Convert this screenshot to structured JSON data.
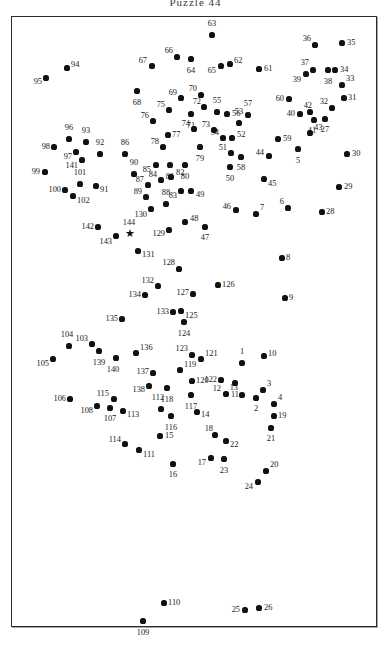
{
  "title": "Puzzle 44",
  "frame": {
    "x": 11,
    "y": 16,
    "width": 366,
    "height": 611,
    "border_color": "#2b2b2b"
  },
  "puzzle": {
    "type": "connect-the-dots",
    "dot_color": "#111111",
    "label_color": "#1a1a1a",
    "start_marker": "★",
    "start_marker_label": "144",
    "total_points": 144
  },
  "chart_data": {
    "type": "scatter",
    "title": "Puzzle 44",
    "xlabel": "",
    "ylabel": "",
    "xlim": [
      0,
      391
    ],
    "ylim": [
      647,
      0
    ],
    "grid": false,
    "legend": "none",
    "points": [
      {
        "n": "1",
        "x": 241,
        "y": 362,
        "lx": 241,
        "ly": 355,
        "pos": "t"
      },
      {
        "n": "2",
        "x": 255,
        "y": 397,
        "lx": 255,
        "ly": 404,
        "pos": "b"
      },
      {
        "n": "3",
        "x": 262,
        "y": 389,
        "lx": 266,
        "ly": 383,
        "pos": "r"
      },
      {
        "n": "4",
        "x": 273,
        "y": 403,
        "lx": 277,
        "ly": 397,
        "pos": "r"
      },
      {
        "n": "5",
        "x": 297,
        "y": 148,
        "lx": 297,
        "ly": 156,
        "pos": "b"
      },
      {
        "n": "6",
        "x": 287,
        "y": 207,
        "lx": 283,
        "ly": 201,
        "pos": "l"
      },
      {
        "n": "7",
        "x": 255,
        "y": 213,
        "lx": 259,
        "ly": 207,
        "pos": "r"
      },
      {
        "n": "8",
        "x": 281,
        "y": 257,
        "lx": 285,
        "ly": 257,
        "pos": "r"
      },
      {
        "n": "9",
        "x": 284,
        "y": 297,
        "lx": 288,
        "ly": 297,
        "pos": "r"
      },
      {
        "n": "10",
        "x": 263,
        "y": 355,
        "lx": 267,
        "ly": 353,
        "pos": "r"
      },
      {
        "n": "11",
        "x": 234,
        "y": 382,
        "lx": 234,
        "ly": 390,
        "pos": "b"
      },
      {
        "n": "12",
        "x": 225,
        "y": 393,
        "lx": 220,
        "ly": 388,
        "pos": "l"
      },
      {
        "n": "13",
        "x": 241,
        "y": 394,
        "lx": 237,
        "ly": 387,
        "pos": "l"
      },
      {
        "n": "14",
        "x": 196,
        "y": 411,
        "lx": 200,
        "ly": 414,
        "pos": "r"
      },
      {
        "n": "15",
        "x": 159,
        "y": 435,
        "lx": 164,
        "ly": 435,
        "pos": "r"
      },
      {
        "n": "16",
        "x": 172,
        "y": 463,
        "lx": 172,
        "ly": 470,
        "pos": "b"
      },
      {
        "n": "17",
        "x": 210,
        "y": 457,
        "lx": 205,
        "ly": 462,
        "pos": "l"
      },
      {
        "n": "18",
        "x": 214,
        "y": 434,
        "lx": 212,
        "ly": 428,
        "pos": "l"
      },
      {
        "n": "19",
        "x": 273,
        "y": 415,
        "lx": 277,
        "ly": 415,
        "pos": "r"
      },
      {
        "n": "20",
        "x": 265,
        "y": 470,
        "lx": 269,
        "ly": 464,
        "pos": "r"
      },
      {
        "n": "21",
        "x": 270,
        "y": 427,
        "lx": 270,
        "ly": 434,
        "pos": "b"
      },
      {
        "n": "22",
        "x": 225,
        "y": 440,
        "lx": 229,
        "ly": 444,
        "pos": "r"
      },
      {
        "n": "23",
        "x": 223,
        "y": 458,
        "lx": 223,
        "ly": 466,
        "pos": "b"
      },
      {
        "n": "24",
        "x": 257,
        "y": 481,
        "lx": 252,
        "ly": 486,
        "pos": "l"
      },
      {
        "n": "25",
        "x": 244,
        "y": 609,
        "lx": 239,
        "ly": 609,
        "pos": "l"
      },
      {
        "n": "26",
        "x": 258,
        "y": 607,
        "lx": 263,
        "ly": 607,
        "pos": "r"
      },
      {
        "n": "27",
        "x": 324,
        "y": 118,
        "lx": 324,
        "ly": 125,
        "pos": "b"
      },
      {
        "n": "28",
        "x": 321,
        "y": 211,
        "lx": 325,
        "ly": 211,
        "pos": "r"
      },
      {
        "n": "29",
        "x": 338,
        "y": 186,
        "lx": 343,
        "ly": 186,
        "pos": "r"
      },
      {
        "n": "30",
        "x": 346,
        "y": 153,
        "lx": 351,
        "ly": 153,
        "pos": "r"
      },
      {
        "n": "31",
        "x": 343,
        "y": 97,
        "lx": 347,
        "ly": 97,
        "pos": "r"
      },
      {
        "n": "32",
        "x": 331,
        "y": 107,
        "lx": 327,
        "ly": 101,
        "pos": "l"
      },
      {
        "n": "33",
        "x": 341,
        "y": 84,
        "lx": 345,
        "ly": 78,
        "pos": "r"
      },
      {
        "n": "34",
        "x": 334,
        "y": 69,
        "lx": 339,
        "ly": 69,
        "pos": "r"
      },
      {
        "n": "35",
        "x": 341,
        "y": 42,
        "lx": 346,
        "ly": 42,
        "pos": "r"
      },
      {
        "n": "36",
        "x": 314,
        "y": 44,
        "lx": 310,
        "ly": 38,
        "pos": "l"
      },
      {
        "n": "37",
        "x": 312,
        "y": 69,
        "lx": 308,
        "ly": 62,
        "pos": "l"
      },
      {
        "n": "38",
        "x": 327,
        "y": 69,
        "lx": 327,
        "ly": 77,
        "pos": "b"
      },
      {
        "n": "39",
        "x": 305,
        "y": 73,
        "lx": 300,
        "ly": 79,
        "pos": "l"
      },
      {
        "n": "40",
        "x": 299,
        "y": 113,
        "lx": 294,
        "ly": 113,
        "pos": "l"
      },
      {
        "n": "41",
        "x": 313,
        "y": 119,
        "lx": 311,
        "ly": 126,
        "pos": "b"
      },
      {
        "n": "42",
        "x": 309,
        "y": 111,
        "lx": 311,
        "ly": 105,
        "pos": "l"
      },
      {
        "n": "43",
        "x": 309,
        "y": 132,
        "lx": 313,
        "ly": 127,
        "pos": "r"
      },
      {
        "n": "44",
        "x": 268,
        "y": 155,
        "lx": 263,
        "ly": 152,
        "pos": "l"
      },
      {
        "n": "45",
        "x": 263,
        "y": 178,
        "lx": 267,
        "ly": 183,
        "pos": "r"
      },
      {
        "n": "46",
        "x": 235,
        "y": 209,
        "lx": 230,
        "ly": 206,
        "pos": "l"
      },
      {
        "n": "47",
        "x": 204,
        "y": 226,
        "lx": 204,
        "ly": 233,
        "pos": "b"
      },
      {
        "n": "48",
        "x": 184,
        "y": 221,
        "lx": 189,
        "ly": 218,
        "pos": "r"
      },
      {
        "n": "49",
        "x": 190,
        "y": 190,
        "lx": 195,
        "ly": 194,
        "pos": "r"
      },
      {
        "n": "50",
        "x": 229,
        "y": 166,
        "lx": 229,
        "ly": 174,
        "pos": "b"
      },
      {
        "n": "51",
        "x": 230,
        "y": 152,
        "lx": 226,
        "ly": 147,
        "pos": "l"
      },
      {
        "n": "52",
        "x": 231,
        "y": 137,
        "lx": 236,
        "ly": 134,
        "pos": "r"
      },
      {
        "n": "53",
        "x": 238,
        "y": 122,
        "lx": 238,
        "ly": 115,
        "pos": "t"
      },
      {
        "n": "54",
        "x": 222,
        "y": 137,
        "lx": 218,
        "ly": 132,
        "pos": "l"
      },
      {
        "n": "55",
        "x": 216,
        "y": 111,
        "lx": 216,
        "ly": 104,
        "pos": "t"
      },
      {
        "n": "56",
        "x": 226,
        "y": 113,
        "lx": 231,
        "ly": 113,
        "pos": "r"
      },
      {
        "n": "57",
        "x": 247,
        "y": 114,
        "lx": 247,
        "ly": 107,
        "pos": "t"
      },
      {
        "n": "58",
        "x": 240,
        "y": 156,
        "lx": 240,
        "ly": 163,
        "pos": "b"
      },
      {
        "n": "59",
        "x": 277,
        "y": 138,
        "lx": 282,
        "ly": 138,
        "pos": "r"
      },
      {
        "n": "60",
        "x": 288,
        "y": 98,
        "lx": 283,
        "ly": 98,
        "pos": "l"
      },
      {
        "n": "61",
        "x": 258,
        "y": 68,
        "lx": 263,
        "ly": 68,
        "pos": "r"
      },
      {
        "n": "62",
        "x": 229,
        "y": 63,
        "lx": 233,
        "ly": 60,
        "pos": "r"
      },
      {
        "n": "63",
        "x": 211,
        "y": 34,
        "lx": 211,
        "ly": 27,
        "pos": "t"
      },
      {
        "n": "64",
        "x": 190,
        "y": 58,
        "lx": 190,
        "ly": 66,
        "pos": "b"
      },
      {
        "n": "65",
        "x": 220,
        "y": 65,
        "lx": 215,
        "ly": 70,
        "pos": "l"
      },
      {
        "n": "66",
        "x": 176,
        "y": 56,
        "lx": 172,
        "ly": 50,
        "pos": "l"
      },
      {
        "n": "67",
        "x": 151,
        "y": 65,
        "lx": 146,
        "ly": 60,
        "pos": "l"
      },
      {
        "n": "68",
        "x": 136,
        "y": 90,
        "lx": 136,
        "ly": 98,
        "pos": "b"
      },
      {
        "n": "69",
        "x": 180,
        "y": 97,
        "lx": 176,
        "ly": 92,
        "pos": "l"
      },
      {
        "n": "70",
        "x": 200,
        "y": 94,
        "lx": 196,
        "ly": 88,
        "pos": "l"
      },
      {
        "n": "71",
        "x": 190,
        "y": 113,
        "lx": 190,
        "ly": 121,
        "pos": "b"
      },
      {
        "n": "72",
        "x": 203,
        "y": 106,
        "lx": 200,
        "ly": 101,
        "pos": "l"
      },
      {
        "n": "73",
        "x": 213,
        "y": 129,
        "lx": 209,
        "ly": 124,
        "pos": "l"
      },
      {
        "n": "74",
        "x": 193,
        "y": 128,
        "lx": 189,
        "ly": 123,
        "pos": "l"
      },
      {
        "n": "75",
        "x": 168,
        "y": 109,
        "lx": 164,
        "ly": 104,
        "pos": "l"
      },
      {
        "n": "76",
        "x": 152,
        "y": 120,
        "lx": 148,
        "ly": 115,
        "pos": "l"
      },
      {
        "n": "77",
        "x": 167,
        "y": 134,
        "lx": 171,
        "ly": 134,
        "pos": "r"
      },
      {
        "n": "78",
        "x": 162,
        "y": 146,
        "lx": 158,
        "ly": 141,
        "pos": "l"
      },
      {
        "n": "79",
        "x": 199,
        "y": 146,
        "lx": 199,
        "ly": 154,
        "pos": "b"
      },
      {
        "n": "80",
        "x": 184,
        "y": 164,
        "lx": 184,
        "ly": 172,
        "pos": "b"
      },
      {
        "n": "81",
        "x": 169,
        "y": 164,
        "lx": 169,
        "ly": 172,
        "pos": "b"
      },
      {
        "n": "82",
        "x": 170,
        "y": 176,
        "lx": 175,
        "ly": 172,
        "pos": "r"
      },
      {
        "n": "83",
        "x": 180,
        "y": 190,
        "lx": 176,
        "ly": 195,
        "pos": "l"
      },
      {
        "n": "84",
        "x": 160,
        "y": 179,
        "lx": 156,
        "ly": 174,
        "pos": "l"
      },
      {
        "n": "85",
        "x": 155,
        "y": 164,
        "lx": 150,
        "ly": 169,
        "pos": "l"
      },
      {
        "n": "86",
        "x": 124,
        "y": 153,
        "lx": 124,
        "ly": 146,
        "pos": "t"
      },
      {
        "n": "87",
        "x": 147,
        "y": 184,
        "lx": 143,
        "ly": 179,
        "pos": "l"
      },
      {
        "n": "88",
        "x": 165,
        "y": 203,
        "lx": 165,
        "ly": 196,
        "pos": "t"
      },
      {
        "n": "89",
        "x": 145,
        "y": 196,
        "lx": 141,
        "ly": 191,
        "pos": "l"
      },
      {
        "n": "90",
        "x": 133,
        "y": 173,
        "lx": 133,
        "ly": 166,
        "pos": "t"
      },
      {
        "n": "91",
        "x": 95,
        "y": 185,
        "lx": 99,
        "ly": 189,
        "pos": "r"
      },
      {
        "n": "92",
        "x": 99,
        "y": 153,
        "lx": 99,
        "ly": 146,
        "pos": "t"
      },
      {
        "n": "93",
        "x": 85,
        "y": 141,
        "lx": 85,
        "ly": 134,
        "pos": "t"
      },
      {
        "n": "94",
        "x": 66,
        "y": 67,
        "lx": 70,
        "ly": 64,
        "pos": "r"
      },
      {
        "n": "95",
        "x": 45,
        "y": 77,
        "lx": 41,
        "ly": 81,
        "pos": "l"
      },
      {
        "n": "96",
        "x": 68,
        "y": 138,
        "lx": 68,
        "ly": 131,
        "pos": "t"
      },
      {
        "n": "97",
        "x": 75,
        "y": 151,
        "lx": 71,
        "ly": 156,
        "pos": "l"
      },
      {
        "n": "98",
        "x": 53,
        "y": 146,
        "lx": 49,
        "ly": 146,
        "pos": "l"
      },
      {
        "n": "99",
        "x": 44,
        "y": 171,
        "lx": 39,
        "ly": 171,
        "pos": "l"
      },
      {
        "n": "100",
        "x": 64,
        "y": 189,
        "lx": 60,
        "ly": 189,
        "pos": "l"
      },
      {
        "n": "101",
        "x": 79,
        "y": 183,
        "lx": 79,
        "ly": 176,
        "pos": "t"
      },
      {
        "n": "102",
        "x": 72,
        "y": 195,
        "lx": 76,
        "ly": 200,
        "pos": "r"
      },
      {
        "n": "103",
        "x": 91,
        "y": 343,
        "lx": 87,
        "ly": 338,
        "pos": "l"
      },
      {
        "n": "104",
        "x": 68,
        "y": 345,
        "lx": 66,
        "ly": 338,
        "pos": "t"
      },
      {
        "n": "105",
        "x": 52,
        "y": 358,
        "lx": 48,
        "ly": 363,
        "pos": "l"
      },
      {
        "n": "106",
        "x": 69,
        "y": 398,
        "lx": 65,
        "ly": 398,
        "pos": "l"
      },
      {
        "n": "107",
        "x": 109,
        "y": 407,
        "lx": 109,
        "ly": 414,
        "pos": "b"
      },
      {
        "n": "108",
        "x": 96,
        "y": 405,
        "lx": 92,
        "ly": 410,
        "pos": "l"
      },
      {
        "n": "109",
        "x": 142,
        "y": 620,
        "lx": 142,
        "ly": 628,
        "pos": "b"
      },
      {
        "n": "110",
        "x": 163,
        "y": 602,
        "lx": 167,
        "ly": 602,
        "pos": "r"
      },
      {
        "n": "111",
        "x": 138,
        "y": 449,
        "lx": 142,
        "ly": 454,
        "pos": "r"
      },
      {
        "n": "112",
        "x": 160,
        "y": 408,
        "lx": 157,
        "ly": 401,
        "pos": "t"
      },
      {
        "n": "113",
        "x": 122,
        "y": 410,
        "lx": 126,
        "ly": 414,
        "pos": "r"
      },
      {
        "n": "114",
        "x": 124,
        "y": 443,
        "lx": 120,
        "ly": 439,
        "pos": "l"
      },
      {
        "n": "115",
        "x": 113,
        "y": 398,
        "lx": 108,
        "ly": 393,
        "pos": "l"
      },
      {
        "n": "116",
        "x": 170,
        "y": 415,
        "lx": 170,
        "ly": 423,
        "pos": "b"
      },
      {
        "n": "117",
        "x": 190,
        "y": 394,
        "lx": 190,
        "ly": 402,
        "pos": "b"
      },
      {
        "n": "118",
        "x": 166,
        "y": 387,
        "lx": 166,
        "ly": 395,
        "pos": "b"
      },
      {
        "n": "119",
        "x": 179,
        "y": 369,
        "lx": 183,
        "ly": 364,
        "pos": "r"
      },
      {
        "n": "120",
        "x": 191,
        "y": 380,
        "lx": 195,
        "ly": 380,
        "pos": "r"
      },
      {
        "n": "121",
        "x": 200,
        "y": 358,
        "lx": 204,
        "ly": 353,
        "pos": "r"
      },
      {
        "n": "122",
        "x": 220,
        "y": 379,
        "lx": 216,
        "ly": 379,
        "pos": "l"
      },
      {
        "n": "123",
        "x": 191,
        "y": 354,
        "lx": 187,
        "ly": 348,
        "pos": "l"
      },
      {
        "n": "124",
        "x": 183,
        "y": 321,
        "lx": 183,
        "ly": 329,
        "pos": "b"
      },
      {
        "n": "125",
        "x": 180,
        "y": 310,
        "lx": 184,
        "ly": 315,
        "pos": "r"
      },
      {
        "n": "126",
        "x": 217,
        "y": 284,
        "lx": 221,
        "ly": 284,
        "pos": "r"
      },
      {
        "n": "127",
        "x": 192,
        "y": 293,
        "lx": 188,
        "ly": 292,
        "pos": "l"
      },
      {
        "n": "128",
        "x": 178,
        "y": 268,
        "lx": 174,
        "ly": 262,
        "pos": "l"
      },
      {
        "n": "129",
        "x": 168,
        "y": 229,
        "lx": 164,
        "ly": 233,
        "pos": "l"
      },
      {
        "n": "130",
        "x": 150,
        "y": 208,
        "lx": 146,
        "ly": 214,
        "pos": "l"
      },
      {
        "n": "131",
        "x": 137,
        "y": 250,
        "lx": 141,
        "ly": 254,
        "pos": "r"
      },
      {
        "n": "132",
        "x": 157,
        "y": 285,
        "lx": 153,
        "ly": 280,
        "pos": "l"
      },
      {
        "n": "133",
        "x": 172,
        "y": 311,
        "lx": 168,
        "ly": 311,
        "pos": "l"
      },
      {
        "n": "134",
        "x": 144,
        "y": 294,
        "lx": 140,
        "ly": 294,
        "pos": "l"
      },
      {
        "n": "135",
        "x": 121,
        "y": 318,
        "lx": 117,
        "ly": 318,
        "pos": "l"
      },
      {
        "n": "136",
        "x": 135,
        "y": 352,
        "lx": 139,
        "ly": 347,
        "pos": "r"
      },
      {
        "n": "137",
        "x": 152,
        "y": 372,
        "lx": 148,
        "ly": 371,
        "pos": "l"
      },
      {
        "n": "138",
        "x": 148,
        "y": 385,
        "lx": 144,
        "ly": 389,
        "pos": "l"
      },
      {
        "n": "139",
        "x": 98,
        "y": 350,
        "lx": 98,
        "ly": 358,
        "pos": "b"
      },
      {
        "n": "140",
        "x": 115,
        "y": 357,
        "lx": 112,
        "ly": 365,
        "pos": "b"
      },
      {
        "n": "141",
        "x": 81,
        "y": 159,
        "lx": 77,
        "ly": 165,
        "pos": "l"
      },
      {
        "n": "142",
        "x": 97,
        "y": 226,
        "lx": 93,
        "ly": 226,
        "pos": "l"
      },
      {
        "n": "143",
        "x": 115,
        "y": 235,
        "lx": 111,
        "ly": 241,
        "pos": "l"
      },
      {
        "n": "144",
        "x": 128,
        "y": 233,
        "lx": 128,
        "ly": 226,
        "pos": "t",
        "marker": "star"
      }
    ]
  }
}
